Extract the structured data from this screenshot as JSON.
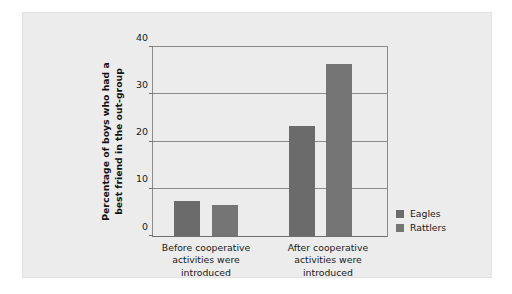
{
  "chart_data": {
    "type": "bar",
    "title": "",
    "subtitle": "",
    "xlabel": "",
    "ylabel": "Percentage of boys who had a best friend in the out-group",
    "ylabel_lines": [
      "Percentage of boys who had a",
      "best friend in the out-group"
    ],
    "categories": [
      "Before cooperative activities were introduced",
      "After cooperative activities were introduced"
    ],
    "category_lines": [
      [
        "Before cooperative",
        "activities were",
        "introduced"
      ],
      [
        "After cooperative",
        "activities were",
        "introduced"
      ]
    ],
    "series": [
      {
        "name": "Eagles",
        "values": [
          7.5,
          23.3
        ],
        "color": "#6b6b6b"
      },
      {
        "name": "Rattlers",
        "values": [
          6.5,
          36.5
        ],
        "color": "#757575"
      }
    ],
    "ylim": [
      0,
      40
    ],
    "yticks": [
      0,
      10,
      20,
      30,
      40
    ],
    "ytick_labels": [
      "0",
      "10",
      "20",
      "30",
      "40"
    ],
    "grid": true,
    "grid_axis": "y",
    "legend_position": "right",
    "legend_entries": [
      "Eagles",
      "Rattlers"
    ]
  },
  "figure": {
    "background_color": "#ececec",
    "plot_background_color": "#ececec",
    "axis_color": "#8b8b8b"
  }
}
